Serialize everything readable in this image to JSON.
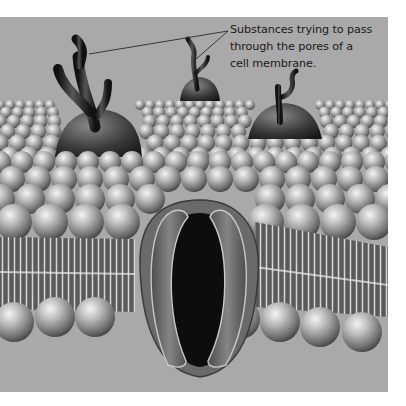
{
  "figure": {
    "annotation": {
      "lines": [
        "Substances trying to pass",
        "through the pores of a",
        "cell membrane."
      ],
      "targets": [
        "large-branched-substance",
        "small-branched-substance"
      ]
    },
    "colors": {
      "background": "#a9a9a9",
      "border": "#ffffff",
      "text": "#1a1a1a",
      "pore_interior": "#0d0d0d"
    }
  }
}
